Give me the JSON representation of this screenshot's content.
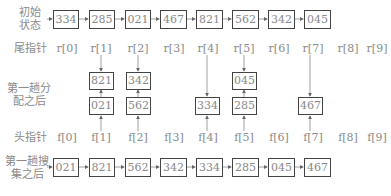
{
  "rows": {
    "initial": {
      "label_line1": "初始",
      "label_line2": "状态",
      "values": [
        "334",
        "285",
        "021",
        "467",
        "821",
        "562",
        "342",
        "045"
      ]
    },
    "after_collect": {
      "label_line1": "第一趟搜",
      "label_line2": "集之后",
      "values": [
        "021",
        "821",
        "562",
        "342",
        "334",
        "285",
        "045",
        "467"
      ]
    }
  },
  "tail_pointers": {
    "label": "尾指针",
    "items": [
      "r[0]",
      "r[1]",
      "r[2]",
      "r[3]",
      "r[4]",
      "r[5]",
      "r[6]",
      "r[7]",
      "r[8]",
      "r[9]"
    ]
  },
  "head_pointers": {
    "label": "头指针",
    "items": [
      "f[0]",
      "f[1]",
      "f[2]",
      "f[3]",
      "f[4]",
      "f[5]",
      "f[6]",
      "f[7]",
      "f[8]",
      "f[9]"
    ]
  },
  "distribution": {
    "label_line1": "第一趟分",
    "label_line2": "配之后",
    "buckets": [
      {
        "bucket": "1",
        "head": "021",
        "tail": "821"
      },
      {
        "bucket": "2",
        "head": "562",
        "tail": "342"
      },
      {
        "bucket": "4",
        "head": "334"
      },
      {
        "bucket": "5",
        "head": "285",
        "tail": "045"
      },
      {
        "bucket": "7",
        "head": "467"
      }
    ]
  }
}
